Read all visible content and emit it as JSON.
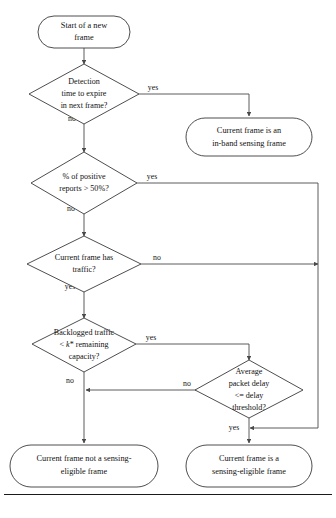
{
  "figure": {
    "caption": ""
  },
  "style": {
    "node_stroke": "#3a3a3a",
    "edge_stroke": "#4a4a4a",
    "text_color": "#111111",
    "background": "#ffffff"
  },
  "nodes": {
    "start": {
      "type": "terminator",
      "lines": [
        "Start of a new",
        "frame"
      ]
    },
    "detection_time": {
      "type": "decision",
      "lines": [
        "Detection",
        "time to expire",
        "in next frame?"
      ]
    },
    "inband_frame": {
      "type": "terminator",
      "lines": [
        "Current frame is an",
        "in-band sensing frame"
      ]
    },
    "positive_reports": {
      "type": "decision",
      "lines": [
        "% of positive",
        "reports > 50%?"
      ]
    },
    "has_traffic": {
      "type": "decision",
      "lines": [
        "Current frame has",
        "traffic?"
      ]
    },
    "backlogged": {
      "type": "decision",
      "lines": [
        "Backlogged traffic",
        "< k* remaining",
        "capacity?"
      ],
      "line_parts": [
        [
          {
            "t": "Backlogged traffic",
            "i": false
          }
        ],
        [
          {
            "t": "< ",
            "i": false
          },
          {
            "t": "k",
            "i": true
          },
          {
            "t": "* remaining",
            "i": false
          }
        ],
        [
          {
            "t": "capacity?",
            "i": false
          }
        ]
      ]
    },
    "avg_delay": {
      "type": "decision",
      "lines": [
        "Average",
        "packet delay",
        "<= delay",
        "threshold?"
      ]
    },
    "not_eligible": {
      "type": "terminator",
      "lines": [
        "Current frame not a sensing-",
        "eligible frame"
      ]
    },
    "eligible": {
      "type": "terminator",
      "lines": [
        "Current frame is a",
        "sensing-eligible frame"
      ]
    }
  },
  "edge_labels": {
    "detection_yes": "yes",
    "detection_no": "no",
    "reports_yes": "yes",
    "reports_no": "no",
    "traffic_no": "no",
    "traffic_yes": "yes",
    "backlogged_yes": "yes",
    "backlogged_no": "no",
    "delay_no": "no",
    "delay_yes": "yes"
  }
}
